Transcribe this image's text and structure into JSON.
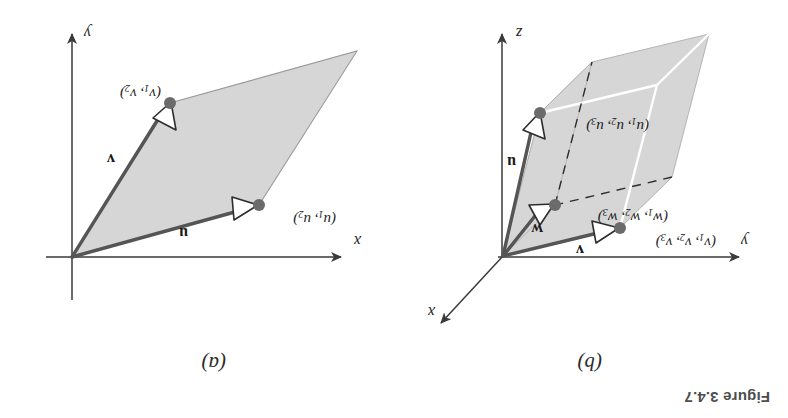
{
  "figure": {
    "caption": "Figure 3.4.7",
    "orientation_degrees": 180,
    "background_color": "#ffffff"
  },
  "colors": {
    "vector_stroke": "#555555",
    "axis_stroke": "#3a3a3a",
    "fill_gray": "#d6d6d6",
    "fill_edge": "#9a9a9a",
    "interior_edge_white": "#ffffff",
    "dot_fill": "#6b6b6b",
    "caption_color": "#4d4d4d"
  },
  "panels": [
    {
      "id": "panel-a",
      "label": "(a)",
      "description": "Parallelogram in the plane spanned by u and v",
      "axes": [
        {
          "name": "x",
          "label": "x"
        },
        {
          "name": "y",
          "label": "y"
        }
      ],
      "vectors": [
        {
          "name": "u",
          "label": "u",
          "point_label_html": "(u<sub>1</sub>, u<sub>2</sub>)"
        },
        {
          "name": "v",
          "label": "v",
          "point_label_html": "(v<sub>1</sub>, v<sub>2</sub>)"
        }
      ]
    },
    {
      "id": "panel-b",
      "label": "(b)",
      "description": "Parallelepiped in space spanned by u, v and w",
      "axes": [
        {
          "name": "x",
          "label": "x"
        },
        {
          "name": "y",
          "label": "y"
        },
        {
          "name": "z",
          "label": "z"
        }
      ],
      "vectors": [
        {
          "name": "u",
          "label": "u",
          "point_label_html": "(u<sub>1</sub>, u<sub>2</sub>, u<sub>3</sub>)"
        },
        {
          "name": "v",
          "label": "v",
          "point_label_html": "(v<sub>1</sub>, v<sub>2</sub>, v<sub>3</sub>)"
        },
        {
          "name": "w",
          "label": "w",
          "point_label_html": "(w<sub>1</sub>, w<sub>2</sub>, w<sub>3</sub>)"
        }
      ]
    }
  ]
}
